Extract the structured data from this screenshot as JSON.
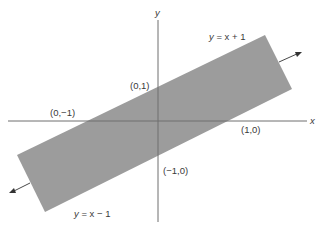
{
  "diagram": {
    "axes": {
      "x_label": "x",
      "y_label": "y"
    },
    "lines": {
      "upper": {
        "lhs": "y",
        "rhs": " = x + 1"
      },
      "lower": {
        "lhs": "y",
        "rhs": " = x − 1"
      }
    },
    "points": {
      "p01": "(0,1)",
      "p0m1": "(0,−1)",
      "p10": "(1,0)",
      "pm10": "(−1,0)"
    },
    "colors": {
      "band_fill": "#9c9c9c",
      "axis": "#6e6e6e",
      "text": "#3a3a3a"
    }
  }
}
